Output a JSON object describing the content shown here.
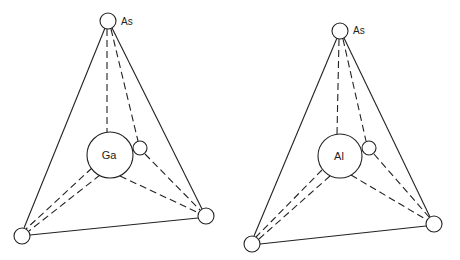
{
  "diagrams": [
    {
      "name": "GaAs tetrahedron",
      "apex": {
        "label": "As",
        "x": 108,
        "y": 21,
        "r": 8
      },
      "center": {
        "label": "Ga",
        "x": 110,
        "y": 155,
        "r": 23
      },
      "small": {
        "x": 140,
        "y": 148,
        "r": 7
      },
      "bottom_left": {
        "x": 22,
        "y": 236,
        "r": 8
      },
      "bottom_right": {
        "x": 206,
        "y": 216,
        "r": 8
      }
    },
    {
      "name": "AlAs tetrahedron",
      "apex": {
        "label": "As",
        "x": 340,
        "y": 31,
        "r": 8
      },
      "center": {
        "label": "Al",
        "x": 340,
        "y": 156,
        "r": 22
      },
      "small": {
        "x": 369,
        "y": 148,
        "r": 7
      },
      "bottom_left": {
        "x": 252,
        "y": 244,
        "r": 8
      },
      "bottom_right": {
        "x": 434,
        "y": 224,
        "r": 8
      }
    }
  ],
  "labels": {
    "left_apex": "As",
    "left_center": "Ga",
    "right_apex": "As",
    "right_center": "Al"
  },
  "colors": {
    "line": "#222222",
    "background": "#ffffff"
  }
}
